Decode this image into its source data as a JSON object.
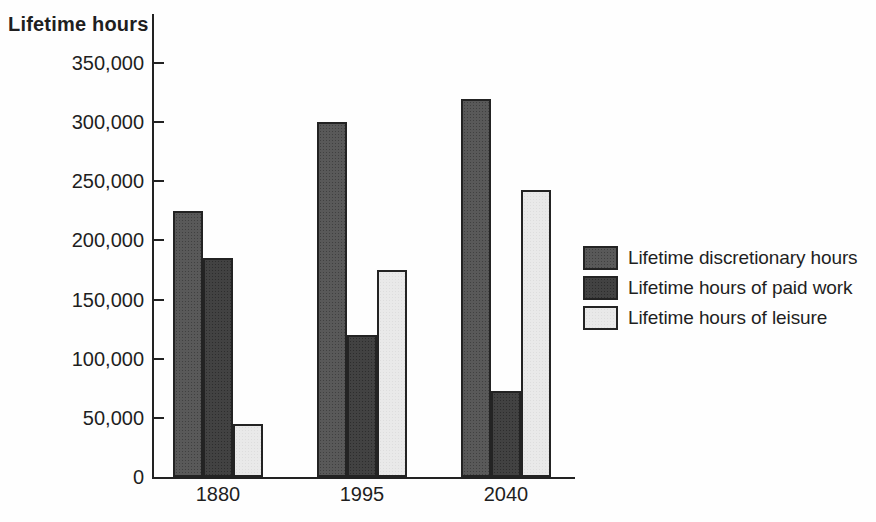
{
  "figure": {
    "axis_title": "Lifetime hours"
  },
  "chart_data": {
    "type": "bar",
    "title": "Lifetime hours",
    "ylabel": "Lifetime hours",
    "xlabel": "",
    "categories": [
      "1880",
      "1995",
      "2040"
    ],
    "series": [
      {
        "name": "Lifetime discretionary hours",
        "color": "#525252",
        "texture": "tex-dark",
        "values": [
          225000,
          300000,
          320000
        ]
      },
      {
        "name": "Lifetime hours of paid work",
        "color": "#3a3a3a",
        "texture": "tex-dark",
        "values": [
          185000,
          120000,
          73000
        ]
      },
      {
        "name": "Lifetime hours of leisure",
        "color": "#e9e9e9",
        "texture": "tex-light",
        "values": [
          45000,
          175000,
          243000
        ]
      }
    ],
    "ylim": [
      0,
      370000
    ],
    "ytick_step": 50000,
    "ytick_values": [
      0,
      50000,
      100000,
      150000,
      200000,
      250000,
      300000,
      350000
    ],
    "ytick_labels": [
      "0",
      "50,000",
      "100,000",
      "150,000",
      "200,000",
      "250,000",
      "300,000",
      "350,000"
    ],
    "grid": false,
    "legend_position": "right-center",
    "bar_edge_color": "#232323",
    "text_color": "#1f1f1f"
  }
}
